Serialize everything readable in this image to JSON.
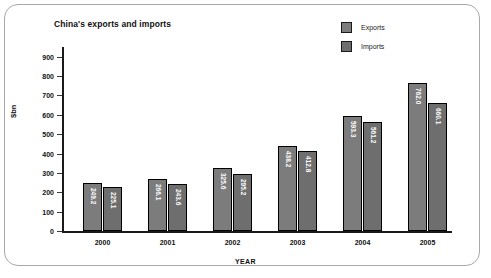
{
  "chart_data": {
    "type": "bar",
    "title": "China's exports and imports",
    "xlabel": "YEAR",
    "ylabel": "$bn",
    "categories": [
      "2000",
      "2001",
      "2002",
      "2003",
      "2004",
      "2005"
    ],
    "series": [
      {
        "name": "Exports",
        "values": [
          249.2,
          266.1,
          325.6,
          438.2,
          593.3,
          762.0
        ],
        "color": "#7c7c7c"
      },
      {
        "name": "Imports",
        "values": [
          225.1,
          243.6,
          295.2,
          412.8,
          561.2,
          660.1
        ],
        "color": "#6e6e6e"
      }
    ],
    "ylim": [
      0,
      950
    ],
    "yticks": [
      0,
      100,
      200,
      300,
      400,
      500,
      600,
      700,
      800,
      900
    ],
    "ytick_labels": [
      "0",
      "100",
      "200",
      "300",
      "400",
      "500",
      "600",
      "700",
      "800",
      "900"
    ],
    "grid": false,
    "legend_position": "top-right",
    "bar_labels": [
      [
        "249.2",
        "225.1"
      ],
      [
        "266.1",
        "243.6"
      ],
      [
        "325.6",
        "295.2"
      ],
      [
        "438.2",
        "412.8"
      ],
      [
        "593.3",
        "561.2"
      ],
      [
        "762.0",
        "660.1"
      ]
    ]
  },
  "legend": {
    "items": [
      {
        "label": "Exports",
        "swatch": "#7c7c7c"
      },
      {
        "label": "Imports",
        "swatch": "#6e6e6e"
      }
    ]
  }
}
